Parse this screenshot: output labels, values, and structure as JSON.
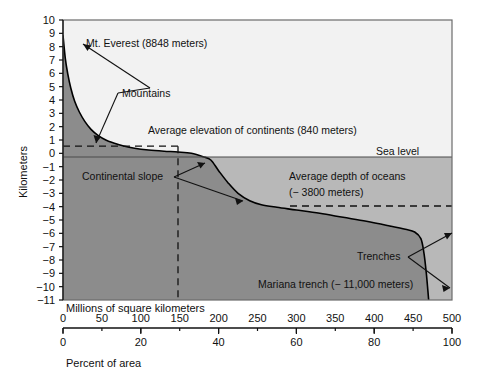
{
  "figure": {
    "name": "hypsographic-curve",
    "background_color": "#ffffff"
  },
  "chart_data": {
    "type": "area",
    "title": "",
    "subtitle": "",
    "xlabel": "Millions of square kilometers",
    "xlabel_secondary": "Percent of area",
    "ylabel": "Kilometers",
    "xlim": [
      0,
      500
    ],
    "xlim_secondary": [
      0,
      100
    ],
    "ylim": [
      -11,
      10
    ],
    "grid": false,
    "legend_position": "none",
    "x_ticks": [
      0,
      50,
      100,
      150,
      200,
      250,
      300,
      350,
      400,
      450,
      500
    ],
    "x_ticks_secondary": [
      0,
      20,
      40,
      60,
      80,
      100
    ],
    "y_ticks": [
      10,
      9,
      8,
      7,
      6,
      5,
      4,
      3,
      2,
      1,
      0,
      -1,
      -2,
      -3,
      -4,
      -5,
      -6,
      -7,
      -8,
      -9,
      -10,
      -11
    ],
    "series": [
      {
        "name": "Hypsographic curve",
        "x_units": "millions of square kilometers",
        "y_units": "kilometers elevation",
        "points": [
          [
            0,
            8.85
          ],
          [
            3,
            7.1
          ],
          [
            6,
            6.0
          ],
          [
            10,
            4.9
          ],
          [
            15,
            3.9
          ],
          [
            21,
            3.1
          ],
          [
            28,
            2.4
          ],
          [
            36,
            1.8
          ],
          [
            45,
            1.35
          ],
          [
            55,
            1.0
          ],
          [
            65,
            0.78
          ],
          [
            78,
            0.55
          ],
          [
            92,
            0.38
          ],
          [
            110,
            0.25
          ],
          [
            130,
            0.16
          ],
          [
            148,
            0.1
          ],
          [
            165,
            0.0
          ],
          [
            180,
            -0.25
          ],
          [
            190,
            -0.5
          ],
          [
            200,
            -1.3
          ],
          [
            212,
            -2.2
          ],
          [
            225,
            -3.0
          ],
          [
            240,
            -3.55
          ],
          [
            255,
            -3.85
          ],
          [
            275,
            -4.05
          ],
          [
            300,
            -4.25
          ],
          [
            330,
            -4.5
          ],
          [
            360,
            -4.8
          ],
          [
            390,
            -5.1
          ],
          [
            420,
            -5.45
          ],
          [
            440,
            -5.7
          ],
          [
            452,
            -5.9
          ],
          [
            460,
            -6.4
          ],
          [
            464,
            -7.5
          ],
          [
            467,
            -9.0
          ],
          [
            469,
            -10.3
          ],
          [
            470,
            -11.0
          ]
        ]
      }
    ],
    "reference_lines": [
      {
        "name": "average-elevation-continents",
        "value": 0.84,
        "orientation": "horizontal",
        "style": "dashed",
        "x_from": 0,
        "x_to": 148,
        "label": "Average elevation of continents (840 meters)"
      },
      {
        "name": "continental-area-boundary",
        "value": 148,
        "orientation": "vertical",
        "style": "dashed",
        "y_from": -11,
        "y_to": 0.84,
        "label": ""
      },
      {
        "name": "average-depth-oceans",
        "value": -3.8,
        "orientation": "horizontal",
        "style": "dashed",
        "x_from": 290,
        "x_to": 500,
        "label": "Average depth of oceans (-3800 meters)"
      },
      {
        "name": "sea-level",
        "value": 0,
        "orientation": "horizontal",
        "style": "solid",
        "x_from": 0,
        "x_to": 500,
        "label": "Sea level"
      }
    ],
    "annotations": [
      {
        "name": "mt-everest",
        "text": "Mt. Everest  (8848 meters)",
        "target_x": 1,
        "target_y": 8.6
      },
      {
        "name": "mountains",
        "text": "Mountains",
        "target_x": 5,
        "target_y": 6.0
      },
      {
        "name": "average-elevation-continents",
        "text": "Average elevation of continents (840 meters)",
        "target_x": 90,
        "target_y": 0.84
      },
      {
        "name": "sea-level",
        "text": "Sea level",
        "target_x": 430,
        "target_y": 0
      },
      {
        "name": "continental-slope",
        "text": "Continental slope",
        "target_x": 188,
        "target_y": -0.4
      },
      {
        "name": "average-depth-oceans-line1",
        "text": "Average depth of  oceans",
        "target_x": 330,
        "target_y": -3.8
      },
      {
        "name": "average-depth-oceans-line2",
        "text": "(− 3800 meters)",
        "target_x": 330,
        "target_y": -3.8
      },
      {
        "name": "trenches",
        "text": "Trenches",
        "target_x": 455,
        "target_y": -6.0
      },
      {
        "name": "mariana-trench",
        "text": "Mariana  trench (− 11,000 meters)",
        "target_x": 470,
        "target_y": -11.0
      }
    ],
    "colors": {
      "land_fill": "#8c8c8c",
      "ocean_fill": "#b8b8b8",
      "above_curve_fill": "#f2f2f2",
      "curve_stroke": "#000000",
      "axis": "#000000",
      "text": "#111111"
    }
  },
  "axes": {
    "y_axis_label": "Kilometers",
    "x_axis_primary_label": "Millions of square kilometers",
    "x_axis_secondary_label": "Percent of area",
    "y_tick_labels": [
      "10",
      "9",
      "8",
      "7",
      "6",
      "5",
      "4",
      "3",
      "2",
      "1",
      "0",
      "−1",
      "−2",
      "−3",
      "−4",
      "−5",
      "−6",
      "−7",
      "−8",
      "−9",
      "−10",
      "−11"
    ],
    "x_tick_labels_primary": [
      "0",
      "50",
      "100",
      "150",
      "200",
      "250",
      "300",
      "350",
      "400",
      "450",
      "500"
    ],
    "x_tick_labels_secondary": [
      "0",
      "20",
      "40",
      "60",
      "80",
      "100"
    ]
  },
  "labels": {
    "mt_everest": "Mt. Everest  (8848 meters)",
    "mountains": "Mountains",
    "avg_elev_continents": "Average elevation of continents (840 meters)",
    "sea_level": "Sea level",
    "continental_slope": "Continental slope",
    "avg_depth_oceans_1": "Average depth of  oceans",
    "avg_depth_oceans_2": "(− 3800 meters)",
    "trenches": "Trenches",
    "mariana_trench": "Mariana  trench (− 11,000 meters)"
  }
}
